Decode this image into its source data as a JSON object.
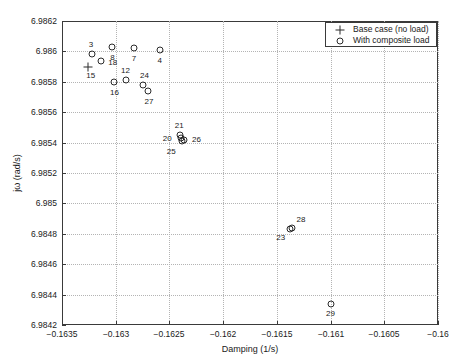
{
  "chart_data": {
    "type": "scatter",
    "title": "",
    "xlabel": "Damping (1/s)",
    "ylabel": "jω (rad/s)",
    "xlim": [
      -0.1635,
      -0.16
    ],
    "ylim": [
      6.9842,
      6.9862
    ],
    "xticks": [
      -0.1635,
      -0.163,
      -0.1625,
      -0.162,
      -0.1615,
      -0.161,
      -0.1605,
      -0.16
    ],
    "xticklabels": [
      "-0.1635",
      "-0.163",
      "-0.1625",
      "-0.162",
      "-0.1615",
      "-0.161",
      "-0.1605",
      "-0.16"
    ],
    "yticks": [
      6.9842,
      6.9844,
      6.9846,
      6.9848,
      6.985,
      6.9852,
      6.9854,
      6.9856,
      6.9858,
      6.986,
      6.9862
    ],
    "yticklabels": [
      "6.9842",
      "6.9844",
      "6.9846",
      "6.9848",
      "6.985",
      "6.9852",
      "6.9854",
      "6.9856",
      "6.9858",
      "6.986",
      "6.9862"
    ],
    "grid": true,
    "legend_position": "upper right",
    "series": [
      {
        "name": "Base case (no load)",
        "marker": "plus",
        "color": "#2b2b2b",
        "points": [
          {
            "label": "15",
            "x": -0.16326,
            "y": 6.9859,
            "label_dx": 3,
            "label_dy": 9
          }
        ]
      },
      {
        "name": "With composite load",
        "marker": "circle",
        "color": "#2b2b2b",
        "points": [
          {
            "label": "8",
            "x": -0.16303,
            "y": 6.98603,
            "label_dx": 0,
            "label_dy": 11
          },
          {
            "label": "7",
            "x": -0.16283,
            "y": 6.98602,
            "label_dx": 0,
            "label_dy": 11
          },
          {
            "label": "4",
            "x": -0.16259,
            "y": 6.98601,
            "label_dx": 0,
            "label_dy": 11
          },
          {
            "label": "3",
            "x": -0.16322,
            "y": 6.98598,
            "label_dx": -1,
            "label_dy": -9
          },
          {
            "label": "18",
            "x": -0.16314,
            "y": 6.98594,
            "label_dx": 12,
            "label_dy": 2
          },
          {
            "label": "12",
            "x": -0.1629,
            "y": 6.98581,
            "label_dx": -1,
            "label_dy": -9
          },
          {
            "label": "16",
            "x": -0.16302,
            "y": 6.9858,
            "label_dx": 1,
            "label_dy": 11
          },
          {
            "label": "24",
            "x": -0.16275,
            "y": 6.98578,
            "label_dx": 2,
            "label_dy": -9
          },
          {
            "label": "27",
            "x": -0.1627,
            "y": 6.98574,
            "label_dx": 1,
            "label_dy": 11
          },
          {
            "label": "21",
            "x": -0.1624,
            "y": 6.98545,
            "label_dx": -1,
            "label_dy": -9
          },
          {
            "label": "26",
            "x": -0.16236,
            "y": 6.98542,
            "label_dx": 12,
            "label_dy": 0
          },
          {
            "label": "20",
            "x": -0.16239,
            "y": 6.98543,
            "label_dx": -14,
            "label_dy": 1
          },
          {
            "label": "25",
            "x": -0.16238,
            "y": 6.98541,
            "label_dx": -11,
            "label_dy": 11
          },
          {
            "label": "28",
            "x": -0.16136,
            "y": 6.98484,
            "label_dx": 9,
            "label_dy": -8
          },
          {
            "label": "23",
            "x": -0.16138,
            "y": 6.98483,
            "label_dx": -9,
            "label_dy": 9
          },
          {
            "label": "29",
            "x": -0.161,
            "y": 6.98434,
            "label_dx": 0,
            "label_dy": 10
          }
        ]
      }
    ],
    "legend": [
      {
        "symbol": "plus",
        "label": "Base case (no load)"
      },
      {
        "symbol": "circle",
        "label": "With composite load"
      }
    ]
  }
}
